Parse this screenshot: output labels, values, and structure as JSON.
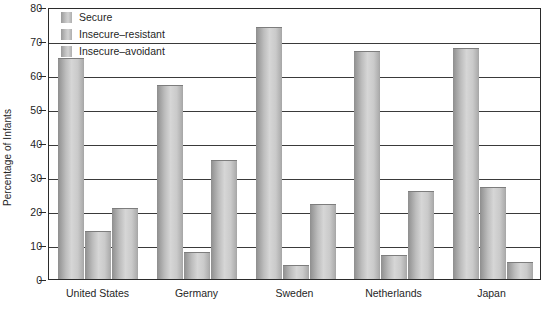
{
  "chart_data": {
    "type": "bar",
    "title": "",
    "subtitle": "",
    "xlabel": "",
    "ylabel": "Percentage of Infants",
    "ylim": [
      0,
      80
    ],
    "y_ticks": [
      0,
      10,
      20,
      30,
      40,
      50,
      60,
      70,
      80
    ],
    "grid": true,
    "legend_position": "top-left",
    "categories": [
      "United States",
      "Germany",
      "Sweden",
      "Netherlands",
      "Japan"
    ],
    "series": [
      {
        "name": "Secure",
        "values": [
          65,
          57,
          74,
          67,
          68
        ]
      },
      {
        "name": "Insecure-resistant",
        "values": [
          14,
          8,
          4,
          7,
          27
        ]
      },
      {
        "name": "Insecure-avoidant",
        "values": [
          21,
          35,
          22,
          26,
          5
        ]
      }
    ],
    "colors": {
      "bar_fill_light": "#d6d6d6",
      "bar_fill_dark": "#8e8e8e",
      "axis": "#2b2b2b",
      "text": "#262626",
      "background": "#ffffff"
    }
  },
  "legend": {
    "items": [
      {
        "label": "Secure"
      },
      {
        "label": "Insecure–resistant"
      },
      {
        "label": "Insecure–avoidant"
      }
    ]
  },
  "axes": {
    "y_title": "Percentage of Infants",
    "y_tick_labels": [
      "80",
      "70",
      "60",
      "50",
      "40",
      "30",
      "20",
      "10",
      "0"
    ],
    "x_tick_labels": [
      "United States",
      "Germany",
      "Sweden",
      "Netherlands",
      "Japan"
    ]
  }
}
